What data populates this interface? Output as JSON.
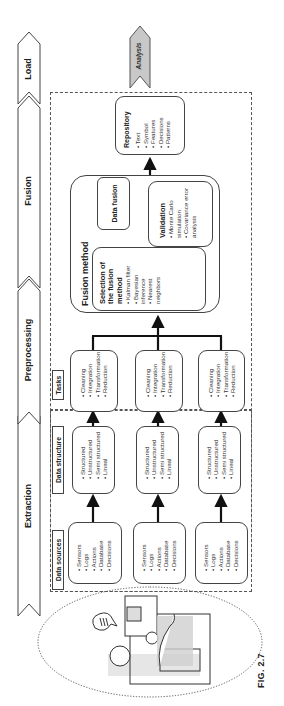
{
  "stages": [
    {
      "label": "Extraction"
    },
    {
      "label": "Preprocessing"
    },
    {
      "label": "Fusion"
    },
    {
      "label": "Load"
    }
  ],
  "output_arrow": {
    "label": "Analysis"
  },
  "sections": {
    "data_sources": {
      "label": "Data sources"
    },
    "data_structure": {
      "label": "Data structure"
    },
    "tasks": {
      "label": "Tasks"
    }
  },
  "data_source_boxes": [
    {
      "items": [
        "Sensors",
        "Logs",
        "Actions",
        "Database",
        "Decisions"
      ]
    },
    {
      "items": [
        "Sensors",
        "Logs",
        "Actions",
        "Database",
        "Decisions"
      ]
    },
    {
      "items": [
        "Sensors",
        "Logs",
        "Actions",
        "Database",
        "Decisions"
      ]
    }
  ],
  "data_structure_boxes": [
    {
      "items": [
        "Structured",
        "Unstructured",
        "Semi structured",
        "Lineal"
      ]
    },
    {
      "items": [
        "Structured",
        "Unstructured",
        "Semi structured",
        "Lineal"
      ]
    },
    {
      "items": [
        "Structured",
        "Unstructured",
        "Semi structured",
        "Lineal"
      ]
    }
  ],
  "task_boxes": [
    {
      "items": [
        "Cleaning",
        "Integration",
        "Transformation",
        "Reduction"
      ]
    },
    {
      "items": [
        "Cleaning",
        "Integration",
        "Transformation",
        "Reduction"
      ]
    },
    {
      "items": [
        "Cleaning",
        "Integration",
        "Transformation",
        "Reduction"
      ]
    }
  ],
  "fusion_method": {
    "title": "Fusion method",
    "selection": {
      "title": "Selection of the fusion method",
      "items": [
        "Kalman filter",
        "Bayesian inference",
        "Nearest neighbors"
      ]
    },
    "data_fusion": {
      "title": "Data fusion"
    },
    "validation": {
      "title": "Validation",
      "items": [
        "Monte Carlo simulation",
        "Covariance error analysis"
      ]
    }
  },
  "repository": {
    "title": "Repository",
    "items": [
      "Text",
      "Symbol",
      "Features",
      "Decisions",
      "Patterns"
    ]
  },
  "caption": "FIG. 2.7",
  "colors": {
    "analysis_fill": "#c8c8c8",
    "line": "#222222",
    "person_shade": "#b5b5b5"
  }
}
